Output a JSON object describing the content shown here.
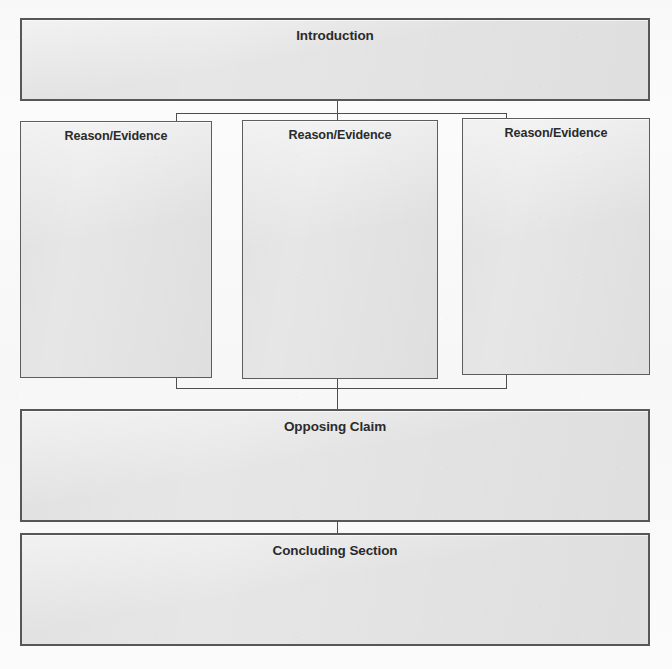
{
  "worksheet": {
    "title": "Argument Writing Graphic Organizer",
    "background_color": "#fbfbfb",
    "box_fill_color": "#e6e6e6",
    "box_border_color": "#575757",
    "text_color": "#2b2b2b"
  },
  "nodes": {
    "introduction": {
      "label": "Introduction",
      "x": 20,
      "y": 18,
      "width": 630,
      "height": 83
    },
    "reason_1": {
      "label": "Reason/Evidence",
      "x": 20,
      "y": 121,
      "width": 192,
      "height": 257
    },
    "reason_2": {
      "label": "Reason/Evidence",
      "x": 242,
      "y": 120,
      "width": 196,
      "height": 259
    },
    "reason_3": {
      "label": "Reason/Evidence",
      "x": 462,
      "y": 118,
      "width": 188,
      "height": 257
    },
    "opposing_claim": {
      "label": "Opposing Claim",
      "x": 20,
      "y": 409,
      "width": 630,
      "height": 113
    },
    "concluding_section": {
      "label": "Concluding Section",
      "x": 20,
      "y": 533,
      "width": 630,
      "height": 113
    }
  },
  "connectors": {
    "intro_stem": {
      "x": 337,
      "y_top": 101,
      "y_bottom": 113
    },
    "intro_bus": {
      "x_left": 176,
      "x_right": 506,
      "y": 113
    },
    "branch_left": {
      "x": 176,
      "y_top": 113,
      "y_bottom": 121
    },
    "branch_middle": {
      "x": 337,
      "y_top": 113,
      "y_bottom": 120
    },
    "branch_right": {
      "x": 506,
      "y_top": 113,
      "y_bottom": 118
    },
    "merge_left": {
      "x": 176,
      "y_top": 378,
      "y_bottom": 388
    },
    "merge_middle": {
      "x": 337,
      "y_top": 379,
      "y_bottom": 388
    },
    "merge_right": {
      "x": 506,
      "y_top": 375,
      "y_bottom": 388
    },
    "merge_bus": {
      "x_left": 176,
      "x_right": 506,
      "y": 388
    },
    "opposing_stem": {
      "x": 337,
      "y_top": 388,
      "y_bottom": 409
    },
    "concluding_stem": {
      "x": 337,
      "y_top": 522,
      "y_bottom": 533
    }
  }
}
